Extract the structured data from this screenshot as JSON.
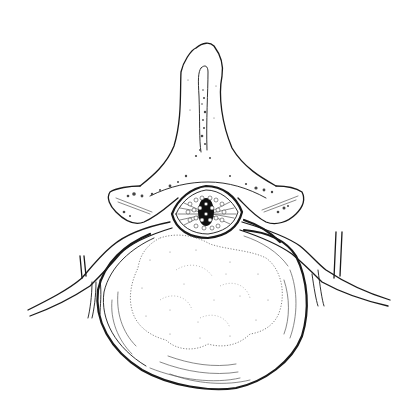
{
  "figure": {
    "type": "anatomical-line-drawing",
    "subject": "lumbar vertebra, axial (superior) view",
    "style": "black ink on white, stippled and hatched",
    "background_color": "#ffffff",
    "ink_color": "#1a1a1a"
  },
  "structures": [
    {
      "id": "spinous-process",
      "description": "Spinous process projecting upward at top center"
    },
    {
      "id": "laminae",
      "description": "Left and right laminae with stippled bone texture"
    },
    {
      "id": "transverse-process-left",
      "description": "Left transverse / articular process"
    },
    {
      "id": "transverse-process-right",
      "description": "Right transverse / articular process"
    },
    {
      "id": "spinal-canal",
      "description": "Oval spinal canal containing cauda equina nerve rootlets"
    },
    {
      "id": "nerve-root-left",
      "description": "Left exiting nerve root branching laterally"
    },
    {
      "id": "nerve-root-right",
      "description": "Right exiting nerve root branching laterally"
    },
    {
      "id": "intervertebral-disc",
      "description": "Disc / vertebral body with concentric annulus lines"
    },
    {
      "id": "nucleus-pulposus",
      "description": "Stippled lobulated nucleus, bulging posteriorly toward canal"
    }
  ]
}
